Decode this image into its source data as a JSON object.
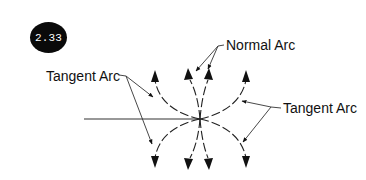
{
  "figure": {
    "badge": "2.33",
    "labels": {
      "tangent_left": "Tangent Arc",
      "normal": "Normal Arc",
      "tangent_right": "Tangent Arc"
    },
    "colors": {
      "line": "#222222",
      "badge_bg": "#0a0a0a",
      "badge_text": "#ffffff"
    }
  }
}
